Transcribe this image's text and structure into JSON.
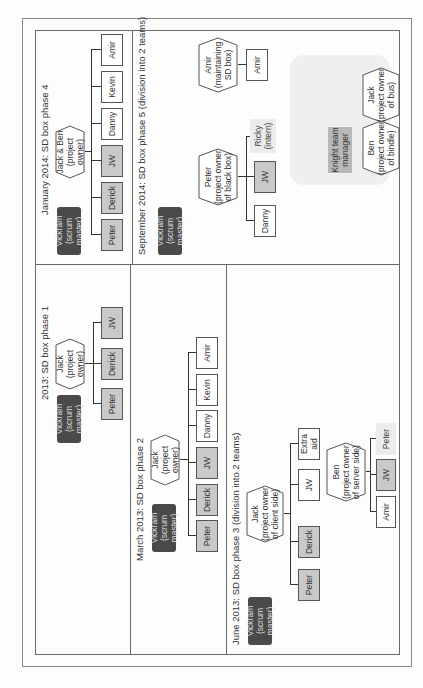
{
  "phases": {
    "p1": {
      "title": "2013: SD box phase 1",
      "scrum_master": {
        "name": "Vickram",
        "role": "(scrum master)"
      },
      "owner": {
        "name": "Jack",
        "role": "(project owner)"
      },
      "members": [
        {
          "name": "Peter",
          "style": "grey"
        },
        {
          "name": "Derick",
          "style": "grey"
        },
        {
          "name": "JW",
          "style": "grey"
        }
      ]
    },
    "p2": {
      "title": "March 2013: SD box phase 2",
      "scrum_master": {
        "name": "Vickram",
        "role": "(scrum master)"
      },
      "owner": {
        "name": "Jack",
        "role": "(project owner)"
      },
      "members": [
        {
          "name": "Peter",
          "style": "grey"
        },
        {
          "name": "Derick",
          "style": "grey"
        },
        {
          "name": "JW",
          "style": "grey"
        },
        {
          "name": "Danny",
          "style": "white"
        },
        {
          "name": "Kevin",
          "style": "white"
        },
        {
          "name": "Amir",
          "style": "white"
        }
      ]
    },
    "p3": {
      "title": "June 2013: SD box phase 3 (division into 2 teams)",
      "scrum_master": {
        "name": "Vickram",
        "role": "(scrum master)"
      },
      "client_owner": {
        "name": "Jack",
        "role1": "(project owner",
        "role2": "of client side)"
      },
      "client_members": [
        {
          "name": "Peter",
          "style": "grey"
        },
        {
          "name": "Derick",
          "style": "grey"
        },
        {
          "name": "JW",
          "style": "white"
        },
        {
          "name": "Extra aid",
          "style": "white"
        }
      ],
      "server_owner": {
        "name": "Ben",
        "role1": "(project owner",
        "role2": "of server side)"
      },
      "server_members": [
        {
          "name": "Amir",
          "style": "white"
        },
        {
          "name": "JW",
          "style": "grey"
        },
        {
          "name": "Peter",
          "style": "light"
        }
      ]
    },
    "p4": {
      "title": "January 2014: SD box phase 4",
      "scrum_master": {
        "name": "Vickram",
        "role": "(scrum master)"
      },
      "owner": {
        "name": "Jack & Ben",
        "role": "(project owner)"
      },
      "members": [
        {
          "name": "Peter",
          "style": "grey"
        },
        {
          "name": "Derick",
          "style": "grey"
        },
        {
          "name": "JW",
          "style": "grey"
        },
        {
          "name": "Danny",
          "style": "white"
        },
        {
          "name": "Kevin",
          "style": "white"
        },
        {
          "name": "Amir",
          "style": "white"
        }
      ]
    },
    "p5": {
      "title": "September 2014: SD box phase 5 (division into 2 teams)",
      "scrum_master": {
        "name": "Vickram",
        "role": "(scrum master)"
      },
      "blackbox_owner": {
        "name": "Peter",
        "role1": "(project owner",
        "role2": "of black box)"
      },
      "blackbox_members": [
        {
          "name": "Danny",
          "style": "white"
        },
        {
          "name": "JW",
          "style": "grey"
        },
        {
          "name": "Ricky",
          "role": "(intern)",
          "style": "light"
        }
      ],
      "maintainer": {
        "name": "Amir",
        "role1": "(maintaining",
        "role2": "SD box)"
      },
      "maintainer_member": {
        "name": "Amir",
        "style": "white"
      },
      "knight_team": {
        "manager": {
          "line1": "Knight team",
          "line2": "manager"
        },
        "ben": {
          "name": "Ben",
          "role1": "(project owner",
          "role2": "of bindle)"
        },
        "jack": {
          "name": "Jack",
          "role1": "(project owner",
          "role2": "of bus)"
        }
      }
    }
  },
  "colors": {
    "scrum_master_bg": "#4a4a4a",
    "grey_box": "#c9c9c9",
    "light_box": "#ececec",
    "white_box": "#ffffff",
    "knight_group_bg": "#efefef",
    "manager_bg": "#b8b8b8"
  }
}
